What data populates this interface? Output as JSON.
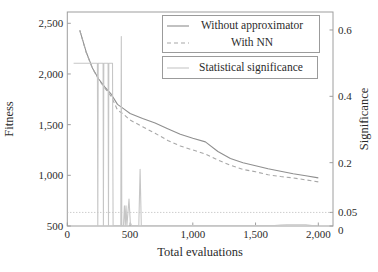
{
  "colors": {
    "axis": "#9e9e9e",
    "text": "#2b2b2b",
    "without_approximator": "#8f8f8f",
    "with_nn": "#a8a8a8",
    "significance": "#c6c6c6",
    "threshold": "#b8b8b8"
  },
  "legend": {
    "without_label": "Without approximator",
    "with_nn_label": "With NN",
    "significance_label": "Statistical significance"
  },
  "chart_data": {
    "type": "line",
    "title": "",
    "xlabel": "Total evaluations",
    "ylabel_left": "Fitness",
    "ylabel_right": "Significance",
    "xlim": [
      0,
      2120
    ],
    "ylim_left": [
      500,
      2610
    ],
    "ylim_right": [
      0,
      0.65
    ],
    "grid": false,
    "legend_position": "top-right, two stacked boxes",
    "x_ticks": [
      0,
      500,
      1000,
      1500,
      2000
    ],
    "x_tick_labels": [
      "0",
      "500",
      "1,000",
      "1,500",
      "2,000"
    ],
    "y_left_ticks": [
      500,
      1000,
      1500,
      2000,
      2500
    ],
    "y_left_tick_labels": [
      "500",
      "1,000",
      "1,500",
      "2,000",
      "2,500"
    ],
    "y_right_ticks": [
      0,
      0.05,
      0.2,
      0.4,
      0.6
    ],
    "y_right_tick_labels": [
      "0",
      "0.05",
      "0.2",
      "0.4",
      "0.6"
    ],
    "threshold_line": {
      "axis": "right",
      "value": 0.05,
      "style": "dotted"
    },
    "series": [
      {
        "name": "Without approximator",
        "axis": "left",
        "style": "solid",
        "x": [
          100,
          150,
          200,
          250,
          300,
          350,
          400,
          450,
          500,
          600,
          700,
          800,
          900,
          1000,
          1100,
          1200,
          1300,
          1400,
          1500,
          1600,
          1700,
          1800,
          1900,
          2000
        ],
        "y": [
          2430,
          2220,
          2060,
          1950,
          1870,
          1800,
          1700,
          1655,
          1610,
          1560,
          1515,
          1460,
          1405,
          1365,
          1330,
          1235,
          1165,
          1125,
          1095,
          1065,
          1040,
          1015,
          995,
          975
        ]
      },
      {
        "name": "With NN",
        "axis": "left",
        "style": "dashed",
        "x": [
          100,
          150,
          200,
          250,
          300,
          350,
          400,
          450,
          500,
          600,
          700,
          800,
          900,
          1000,
          1100,
          1200,
          1300,
          1400,
          1500,
          1600,
          1700,
          1800,
          1900,
          2000
        ],
        "y": [
          2430,
          2215,
          2055,
          1945,
          1860,
          1780,
          1645,
          1600,
          1545,
          1480,
          1415,
          1345,
          1290,
          1250,
          1210,
          1150,
          1100,
          1058,
          1035,
          1005,
          988,
          975,
          955,
          935
        ]
      },
      {
        "name": "Statistical significance",
        "axis": "right",
        "style": "solid",
        "x": [
          50,
          240,
          243,
          246,
          285,
          288,
          291,
          325,
          328,
          331,
          360,
          365,
          370,
          426,
          430,
          434,
          448,
          455,
          462,
          468,
          475,
          492,
          502,
          512,
          570,
          580,
          590,
          620,
          800,
          1000,
          1200,
          1400,
          1450,
          1500,
          1600,
          1650,
          1700,
          1750,
          1800,
          1900,
          1950,
          2000
        ],
        "y": [
          0.5,
          0.5,
          0.0,
          0.5,
          0.5,
          0.0,
          0.5,
          0.5,
          0.0,
          0.5,
          0.5,
          0.0,
          0.0,
          0.0,
          0.58,
          0.0,
          0.0,
          0.07,
          0.0,
          0.07,
          0.0,
          0.09,
          0.02,
          0.0,
          0.0,
          0.18,
          0.0,
          0.004,
          0.004,
          0.004,
          0.005,
          0.006,
          0.009,
          0.009,
          0.005,
          0.005,
          0.012,
          0.013,
          0.013,
          0.013,
          0.01,
          0.002
        ]
      }
    ]
  },
  "plot_geometry": {
    "left": 67.3,
    "right": 333,
    "top": 12,
    "bottom": 226,
    "x_data_min": 0,
    "x_data_max": 2000,
    "x_px_min": 67.3,
    "x_px_max": 318.3,
    "fit_min": 500,
    "fit_max": 2500,
    "fit_px_min": 226,
    "fit_px_max": 23.3,
    "sig_zero_px": 229,
    "sig_px_per_unit": 331.7
  }
}
